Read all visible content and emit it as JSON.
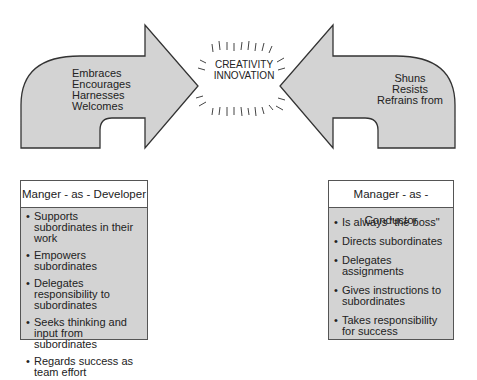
{
  "diagram": {
    "center": {
      "line1": "CREATIVITY",
      "line2": "INNOVATION"
    },
    "left_arrow": {
      "direction": "right",
      "words": [
        "Embraces",
        "Encourages",
        "Harnesses",
        "Welcomes"
      ]
    },
    "right_arrow": {
      "direction": "left",
      "words": [
        "Shuns",
        "Resists",
        "Refrains from"
      ]
    },
    "developer_box": {
      "title": "Manger - as - Developer",
      "items": [
        "Supports subordinates in their work",
        "Empowers subordinates",
        "Delegates responsibility to subordinates",
        "Seeks thinking and input from subordinates",
        "Regards success as team effort"
      ]
    },
    "conductor_box": {
      "title": "Manager - as - Conductor",
      "items": [
        "Is always \"the boss\"",
        "Directs subordinates",
        "Delegates assignments",
        "Gives instructions to subordinates",
        "Takes responsibility for success"
      ]
    },
    "colors": {
      "arrow_fill": "#d3d3d3",
      "stroke": "#333333",
      "header_fill": "#ffffff"
    }
  }
}
